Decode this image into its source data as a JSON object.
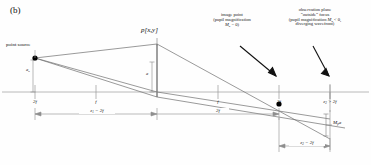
{
  "figure": {
    "panel_label": "(b)",
    "type": "optical ray diagram"
  },
  "labels": {
    "point_source": "point source",
    "field_point": "p[x,y]",
    "aperture_height": "a",
    "source_height": "a",
    "pupil_mag_height": "M",
    "pupil_mag_height_sub": "p",
    "pupil_mag_height_tail": "a"
  },
  "annotations": {
    "image_point": {
      "line1": "image point",
      "line2": "(pupil magnification",
      "line3_pre": "M",
      "line3_sub": "p",
      "line3_post": " = 0)"
    },
    "observation_plane": {
      "line1": "observation plane",
      "line2": "“outside” focus",
      "line3_pre": "(pupil magnification ",
      "line3_m": "M",
      "line3_sub": "p",
      "line3_post": " < 0,",
      "line4": "diverging wavefront)"
    }
  },
  "axis": {
    "ticks": [
      {
        "label": "2f",
        "x": 35
      },
      {
        "label": "f",
        "x": 96
      },
      {
        "label": "f",
        "x": 218
      },
      {
        "label": "2f",
        "x": 279
      }
    ],
    "obs_tick": {
      "pre": "z",
      "sub": "2",
      "post": " > 2f",
      "x": 330
    }
  },
  "dimensions": {
    "z1": {
      "pre": "z",
      "sub": "1",
      "post": " = 2f",
      "from": 35,
      "to": 157
    },
    "f2": {
      "label": "2f",
      "from": 157,
      "to": 279
    },
    "z2": {
      "pre": "z",
      "sub": "2",
      "post": " − 2f",
      "from": 279,
      "to": 330
    }
  },
  "colors": {
    "ray": "#6b6b6b",
    "axis": "#9a9a9a",
    "arrow": "#111111",
    "point": "#000000",
    "lens": "#8a8a8a",
    "background": "#fefefe"
  },
  "geometry": {
    "source_x": 35,
    "source_y": 58,
    "lens_x": 157,
    "axis_y": 92,
    "top_ray_y": 44,
    "image_x": 279,
    "image_y": 104,
    "obs_x": 330
  }
}
